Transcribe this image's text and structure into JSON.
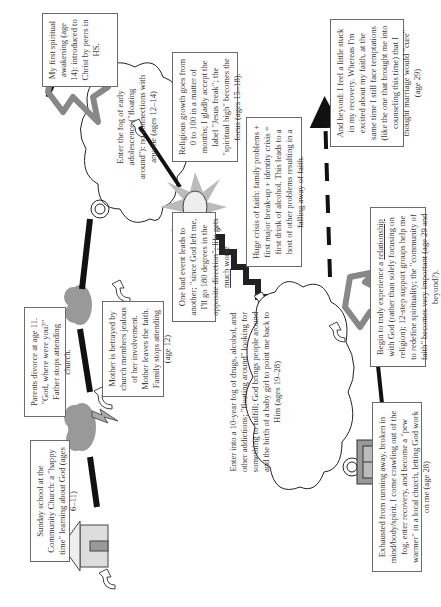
{
  "diagram": {
    "type": "spiritual-journey-timeline",
    "orientation": "rotated-90-ccw",
    "colors": {
      "path_dark": "#1a1a1a",
      "dove_gray": "#8c8c8c",
      "storm_cloud": "#9a9a9a",
      "box_border": "#6b6b6b",
      "text": "#3a3a3a"
    },
    "stages": [
      {
        "id": "sunday-school",
        "icon": "church-icon",
        "text": "Sunday school at the Community Church: a \"happy time\" learning about God (ages 6–11)"
      },
      {
        "id": "parents-divorce",
        "icon": "storm-cloud-lightning-icon",
        "text": "Parents divorce at age 11. \"God, where were you?\" Father stops attending church."
      },
      {
        "id": "mother-betrayed",
        "icon": "storm-cloud-icon",
        "text": "Mother is betrayed by church members jealous of her involvement. Mother leaves the faith. Family stops attending (age 12)"
      },
      {
        "id": "fog-adolescence",
        "icon": "fog-cloud-icon",
        "text": "Enter the fog of early adolescence (\"floating around\"): no connections with anyone (ages 12–14)"
      },
      {
        "id": "first-awakening",
        "icon": "dove-icon",
        "text": "My first spiritual awakening (age 14): introduced to Christ by peers in HS."
      },
      {
        "id": "religious-growth",
        "icon": "dove-icon",
        "text": "Religious growth goes from 0 to 100 in a matter of months; I gladly accept the label \"Jesus freak\"; the \"spiritual high\" becomes the focus (ages 15–18)."
      },
      {
        "id": "crisis-of-faith",
        "icon": "explosion-cloud-icon",
        "text": "Huge crisis of faith: family problems + first major break-up + identity crisis = first drink of alcohol. This leads to a host of other problems resulting in a falling away of faith."
      },
      {
        "id": "one-bad-event",
        "icon": "staircase-down-icon",
        "text_before": "One bad event leads to another; \"since God left me, I'll go 180 degrees in the opposite direction\"; life gets ",
        "text_underlined": "much",
        "text_after": " worse"
      },
      {
        "id": "ten-year-fog",
        "icon": "fog-cloud-icon",
        "text": "Enter into a 10-year fog of drugs, alcohol, and other addictions; \"floating around\" looking for something to fulfill; God brings people around and the birth of a baby girl to point me back to Him (ages 19–28)"
      },
      {
        "id": "exhausted",
        "icon": "church-door-icon",
        "text": "Exhausted from running away, broken in mind/body/spirit, I come crawling out of the fog, enter recovery, and become a \"pew warmer\" in a local church, letting God work on me (age 28)"
      },
      {
        "id": "relationship",
        "icon": "dove-icon",
        "text_before": "Begin to truly experience a ",
        "text_underlined": "relationship",
        "text_after": " with God (rather than solely focusing on religion); 12-step support groups help me to redefine spirituality; the \"community of faith\" becomes very important (age 29 and beyond?)."
      },
      {
        "id": "and-beyond",
        "icon": "dashed-arrow-icon",
        "text": "And beyond: I feel a little stuck in my recovery. Whereas I'm excited about my faith, at the same time I still face temptations (like the one that brought me into counseling this time) that I thought marriage would \"cure\" (age 29)"
      }
    ]
  }
}
